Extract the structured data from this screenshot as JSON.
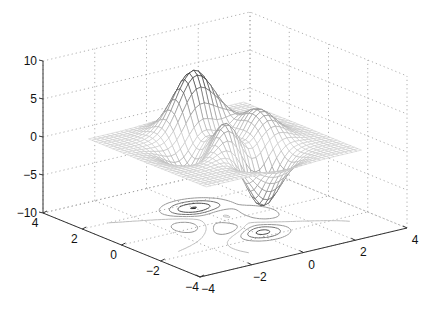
{
  "chart_data": {
    "type": "surface",
    "subtype": "mesh with contour (meshc)",
    "title": "",
    "function": "peaks: z = 3(1-x)^2 e^(-x^2-(y+1)^2) - 10(x/5 - x^3 - y^5) e^(-x^2-y^2) - 1/3 e^(-(x+1)^2-y^2)",
    "grid_points": 25,
    "xlim": [
      -4,
      4
    ],
    "ylim": [
      -4,
      4
    ],
    "zlim": [
      -10,
      10
    ],
    "xticks": [
      -4,
      -2,
      0,
      2,
      4
    ],
    "yticks": [
      -4,
      -2,
      0,
      2,
      4
    ],
    "zticks": [
      -10,
      -5,
      0,
      5,
      10
    ],
    "xtick_labels": [
      "−4",
      "−2",
      "0",
      "2",
      "4"
    ],
    "ytick_labels": [
      "−4",
      "−2",
      "0",
      "2",
      "4"
    ],
    "ztick_labels": [
      "−10",
      "−5",
      "0",
      "5",
      "10"
    ],
    "xlabel": "",
    "ylabel": "",
    "zlabel": "",
    "grid": true,
    "legend": null,
    "peak_values": {
      "max": 8.1,
      "min": -6.5
    },
    "contour_levels": [
      -6,
      -4,
      -2,
      0,
      2,
      4,
      6,
      8
    ],
    "colors": {
      "mesh_light": "#c4c4c4",
      "mesh_dark": "#1e1e1e",
      "grid": "#9a9a9a",
      "axis": "#333333"
    }
  }
}
